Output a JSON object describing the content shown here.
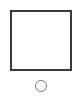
{
  "canvas": {
    "width": 77,
    "height": 97,
    "background": "#ffffff"
  },
  "shapes": {
    "square": {
      "type": "square-outline",
      "stroke": "#3a3a3a"
    },
    "circle": {
      "type": "circle-outline",
      "stroke": "#7a7a7a"
    }
  }
}
